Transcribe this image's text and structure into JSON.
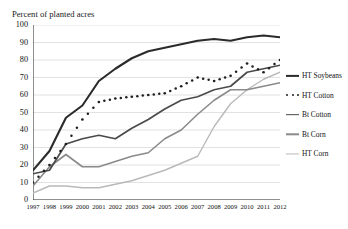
{
  "figure": {
    "cut_off_header": "· · · · ·",
    "axis_title": "Percent of planted acres"
  },
  "legend": {
    "position": "right",
    "items": [
      {
        "label": "HT Soybeans",
        "swatch": "thick-solid-line-icon",
        "color": "#2b2b2b",
        "key": "ht_soybeans"
      },
      {
        "label": "HT Cotton",
        "swatch": "dotted-line-icon",
        "color": "#1f1f1f",
        "key": "ht_cotton"
      },
      {
        "label": "Bt Cotton",
        "swatch": "medium-solid-line-icon",
        "color": "#4a4a4a",
        "key": "bt_cotton"
      },
      {
        "label": "Bt Corn",
        "swatch": "thin-solid-line-icon",
        "color": "#8a8a8a",
        "key": "bt_corn"
      },
      {
        "label": "HT Corn",
        "swatch": "light-solid-line-icon",
        "color": "#b9b9b9",
        "key": "ht_corn"
      }
    ]
  },
  "chart_data": {
    "type": "line",
    "title": "",
    "xlabel": "",
    "ylabel": "Percent of planted acres",
    "xlim": [
      1997,
      2012
    ],
    "ylim": [
      0,
      100
    ],
    "ytick_step": 10,
    "grid": true,
    "grid_axis": "y",
    "legend_position": "right",
    "x": [
      1997,
      1998,
      1999,
      2000,
      2001,
      2002,
      2003,
      2004,
      2005,
      2006,
      2007,
      2008,
      2009,
      2010,
      2011,
      2012
    ],
    "yticks": [
      0,
      10,
      20,
      30,
      40,
      50,
      60,
      70,
      80,
      90,
      100
    ],
    "xticklabels": [
      "1997",
      "1998",
      "1999",
      "2000",
      "2001",
      "2002",
      "2003",
      "2004",
      "2005",
      "2006",
      "2007",
      "2008",
      "2009",
      "2010",
      "2011",
      "2012"
    ],
    "yticklabels": [
      "0",
      "10",
      "20",
      "30",
      "40",
      "50",
      "60",
      "70",
      "80",
      "90",
      "100"
    ],
    "series": [
      {
        "name": "HT Soybeans",
        "style": "thick-solid",
        "color": "#2b2b2b",
        "width": 2.1,
        "values": [
          17,
          28,
          47,
          54,
          68,
          75,
          81,
          85,
          87,
          89,
          91,
          92,
          91,
          93,
          94,
          93
        ]
      },
      {
        "name": "HT Cotton",
        "style": "dotted",
        "color": "#1f1f1f",
        "width": 2.0,
        "values": [
          10,
          20,
          32,
          46,
          56,
          58,
          59,
          60,
          61,
          65,
          70,
          68,
          71,
          78,
          73,
          80
        ]
      },
      {
        "name": "Bt Cotton",
        "style": "medium-solid",
        "color": "#4a4a4a",
        "width": 1.7,
        "values": [
          15,
          17,
          32,
          35,
          37,
          35,
          41,
          46,
          52,
          57,
          59,
          63,
          65,
          73,
          75,
          77
        ]
      },
      {
        "name": "Bt Corn",
        "style": "thin-solid",
        "color": "#8a8a8a",
        "width": 1.6,
        "values": [
          8,
          19,
          26,
          19,
          19,
          22,
          25,
          27,
          35,
          40,
          49,
          57,
          63,
          63,
          65,
          67
        ]
      },
      {
        "name": "HT Corn",
        "style": "light-solid",
        "color": "#b9b9b9",
        "width": 1.4,
        "values": [
          4,
          8,
          8,
          7,
          7,
          9,
          11,
          14,
          17,
          21,
          25,
          42,
          55,
          63,
          69,
          73
        ]
      }
    ]
  }
}
